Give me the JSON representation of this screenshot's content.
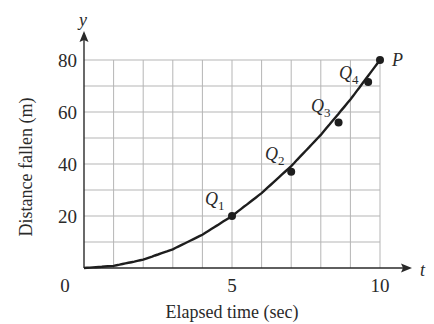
{
  "chart_data": {
    "type": "line",
    "title": "",
    "xlabel": "Elapsed time (sec)",
    "ylabel": "Distance fallen (m)",
    "x_axis_var": "t",
    "y_axis_var": "y",
    "xlim": [
      0,
      10
    ],
    "ylim": [
      0,
      80
    ],
    "x_ticks": [
      0,
      5,
      10
    ],
    "y_ticks": [
      0,
      20,
      40,
      60,
      80
    ],
    "grid": true,
    "grid_x_step": 1,
    "grid_y_step": 10,
    "legend": null,
    "series": [
      {
        "name": "distance curve",
        "x": [
          0,
          1,
          2,
          3,
          4,
          5,
          6,
          7,
          8,
          9,
          10
        ],
        "values": [
          0,
          0.8,
          3.2,
          7.2,
          12.8,
          20,
          28.8,
          39.2,
          51.2,
          64.8,
          80
        ]
      }
    ],
    "points": [
      {
        "label": "Q",
        "sub": "1",
        "t": 5,
        "y": 20
      },
      {
        "label": "Q",
        "sub": "2",
        "t": 7,
        "y": 37
      },
      {
        "label": "Q",
        "sub": "3",
        "t": 8.6,
        "y": 56
      },
      {
        "label": "Q",
        "sub": "4",
        "t": 9.6,
        "y": 71.5
      },
      {
        "label": "P",
        "sub": "",
        "t": 10,
        "y": 80
      }
    ]
  },
  "labels": {
    "y_axis_var": "y",
    "x_axis_var": "t",
    "xlabel": "Elapsed time (sec)",
    "ylabel": "Distance fallen (m)",
    "x_tick_0": "0",
    "x_tick_5": "5",
    "x_tick_10": "10",
    "y_tick_20": "20",
    "y_tick_40": "40",
    "y_tick_60": "60",
    "y_tick_80": "80",
    "q1": "Q",
    "q1_sub": "1",
    "q2": "Q",
    "q2_sub": "2",
    "q3": "Q",
    "q3_sub": "3",
    "q4": "Q",
    "q4_sub": "4",
    "p": "P"
  },
  "colors": {
    "grid": "#b5b5b5",
    "axis": "#2a2a2a",
    "curve": "#1e1e1e",
    "text": "#2a2a2a"
  }
}
